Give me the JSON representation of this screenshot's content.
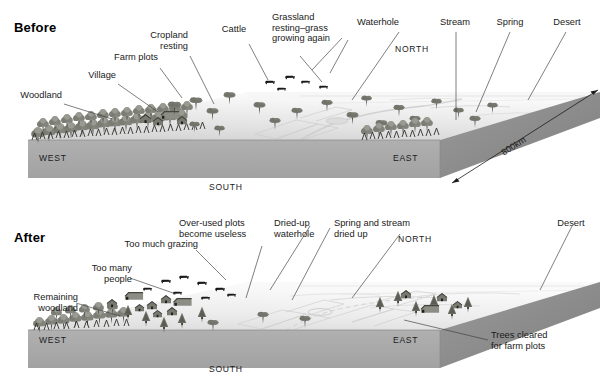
{
  "figure": {
    "type": "landscape-block-diagram",
    "scale_label": "800km"
  },
  "panels": [
    {
      "id": "before",
      "title": "Before",
      "compass": {
        "north": "NORTH",
        "south": "SOUTH",
        "east": "EAST",
        "west": "WEST"
      },
      "scale_arrow": "800km",
      "labels": [
        {
          "name": "woodland",
          "text": "Woodland"
        },
        {
          "name": "village",
          "text": "Village"
        },
        {
          "name": "farm-plots",
          "text": "Farm plots"
        },
        {
          "name": "cropland-resting",
          "text": "Cropland\nresting"
        },
        {
          "name": "cattle",
          "text": "Cattle"
        },
        {
          "name": "grassland-resting",
          "text": "Grassland\nresting–grass\ngrowing again"
        },
        {
          "name": "waterhole",
          "text": "Waterhole"
        },
        {
          "name": "stream",
          "text": "Stream"
        },
        {
          "name": "spring",
          "text": "Spring"
        },
        {
          "name": "desert",
          "text": "Desert"
        }
      ]
    },
    {
      "id": "after",
      "title": "After",
      "compass": {
        "north": "NORTH",
        "south": "SOUTH",
        "east": "EAST",
        "west": "WEST"
      },
      "labels": [
        {
          "name": "remaining-woodland",
          "text": "Remaining\nwoodland"
        },
        {
          "name": "too-many-people",
          "text": "Too many\npeople"
        },
        {
          "name": "too-much-grazing",
          "text": "Too much grazing"
        },
        {
          "name": "over-used-plots",
          "text": "Over-used plots\nbecome useless"
        },
        {
          "name": "dried-up-waterhole",
          "text": "Dried-up\nwaterhole"
        },
        {
          "name": "spring-stream-dried",
          "text": "Spring and stream\ndried up"
        },
        {
          "name": "desert",
          "text": "Desert"
        },
        {
          "name": "trees-cleared",
          "text": "Trees cleared\nfor farm plots"
        }
      ]
    }
  ],
  "colors": {
    "slab_front": "#a8a8a8",
    "slab_side": "#8e8e8e",
    "ground_near": "#d9d9d9",
    "ground_far": "#f2f2f2",
    "woodland": "#8f9189",
    "tree_dark": "#5f6157",
    "cattle": "#1d1d1d",
    "leader": "#3a3a3a",
    "text": "#1a1a1a",
    "background": "#ffffff"
  }
}
